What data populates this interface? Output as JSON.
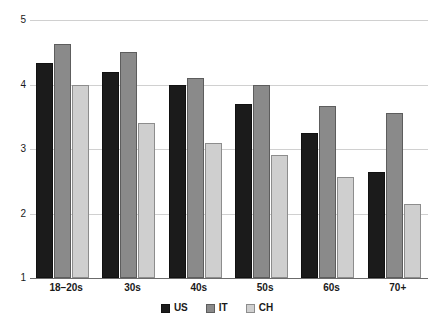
{
  "chart_data": {
    "type": "bar",
    "title": "",
    "subtitle": "",
    "xlabel": "",
    "ylabel": "",
    "categories": [
      "18–20s",
      "30s",
      "40s",
      "50s",
      "60s",
      "70+"
    ],
    "series": [
      {
        "name": "US",
        "color": "#1b1b1b",
        "values": [
          4.33,
          4.2,
          4.0,
          3.7,
          3.25,
          2.65
        ]
      },
      {
        "name": "IT",
        "color": "#8a8a8a",
        "values": [
          4.63,
          4.5,
          4.1,
          4.0,
          3.67,
          3.56
        ]
      },
      {
        "name": "CH",
        "color": "#cfcfcf",
        "values": [
          4.0,
          3.4,
          3.1,
          2.9,
          2.56,
          2.15
        ]
      }
    ],
    "ylim": [
      1,
      5
    ],
    "yticks": [
      1,
      2,
      3,
      4,
      5
    ],
    "ytick_labels": [
      "1",
      "2",
      "3",
      "4",
      "5"
    ],
    "grid": true,
    "grid_axis": "y",
    "legend": true,
    "legend_position": "bottom-center",
    "legend_entries": [
      "US",
      "IT",
      "CH"
    ],
    "bar_baseline": 1,
    "annotations": []
  },
  "axis": {
    "y_tick_labels": [
      "5",
      "4",
      "3",
      "2",
      "1"
    ]
  }
}
